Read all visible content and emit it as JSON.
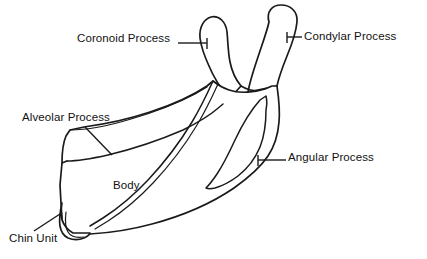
{
  "figure": {
    "style": "black line art on white background",
    "background_color": "#ffffff",
    "line_color": "#1a1a1a"
  },
  "labels": {
    "coronoid": "Coronoid Process",
    "condylar": "Condylar Process",
    "alveolar": "Alveolar Process",
    "angular": "Angular Process",
    "body": "Body",
    "chin": "Chin Unit"
  },
  "parts": [
    {
      "id": "coronoid",
      "label": "Coronoid Process",
      "label_x": 77,
      "label_y": 33,
      "leader": "horizontal with end tick",
      "points_to": "upper-left pointed process"
    },
    {
      "id": "condylar",
      "label": "Condylar Process",
      "label_x": 304,
      "label_y": 31,
      "leader": "horizontal with start tick",
      "points_to": "upper-right rounded head"
    },
    {
      "id": "alveolar",
      "label": "Alveolar Process",
      "label_x": 22,
      "label_y": 112,
      "leader": "diagonal down-right",
      "points_to": "upper tooth-bearing band"
    },
    {
      "id": "angular",
      "label": "Angular Process",
      "label_x": 288,
      "label_y": 152,
      "leader": "horizontal with start tick",
      "points_to": "posterior inferior corner"
    },
    {
      "id": "body",
      "label": "Body",
      "label_x": 113,
      "label_y": 180,
      "leader": "none",
      "points_to": "main horizontal portion"
    },
    {
      "id": "chin",
      "label": "Chin Unit",
      "label_x": 9,
      "label_y": 233,
      "leader": "short diagonal up-right",
      "points_to": "lower-left chin prominence"
    }
  ]
}
